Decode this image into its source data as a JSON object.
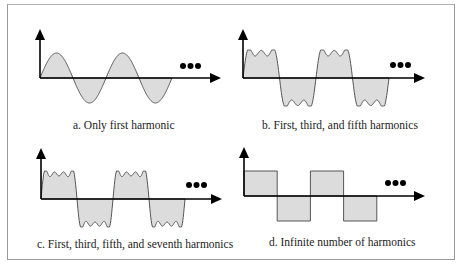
{
  "figure": {
    "panels": [
      {
        "id": "a",
        "caption": "a. Only first harmonic",
        "waveform": "sine",
        "harmonics": [
          1
        ],
        "half_cycles": 4,
        "continuation": "..."
      },
      {
        "id": "b",
        "caption": "b. First, third, and fifth harmonics",
        "waveform": "fourier-square",
        "harmonics": [
          1,
          3,
          5
        ],
        "half_cycles": 4,
        "continuation": "..."
      },
      {
        "id": "c",
        "caption": "c. First, third, fifth, and seventh harmonics",
        "waveform": "fourier-square",
        "harmonics": [
          1,
          3,
          5,
          7
        ],
        "half_cycles": 4,
        "continuation": "..."
      },
      {
        "id": "d",
        "caption": "d. Infinite number of harmonics",
        "waveform": "square",
        "harmonics": "infinite",
        "half_cycles": 4,
        "continuation": "..."
      }
    ],
    "colors": {
      "fill": "#dcdcdc",
      "stroke": "#555555",
      "axis": "#000000"
    }
  }
}
